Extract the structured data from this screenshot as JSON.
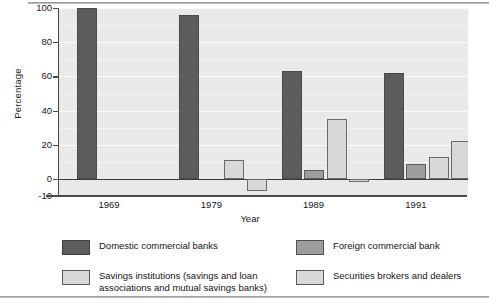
{
  "chart_data": {
    "type": "bar",
    "title": "",
    "xlabel": "Year",
    "ylabel": "Percentage",
    "categories": [
      "1969",
      "1979",
      "1989",
      "1991"
    ],
    "ylim": [
      -10,
      100
    ],
    "yticks": [
      -10,
      0,
      20,
      40,
      60,
      80,
      100
    ],
    "ytick_labels": [
      "-10",
      "0",
      "20",
      "40",
      "60",
      "80",
      "100"
    ],
    "grid": true,
    "legend_position": "below",
    "series": [
      {
        "name": "Domestic commercial banks",
        "color": "#5c5c5c",
        "values": [
          100,
          96,
          63,
          62
        ]
      },
      {
        "name": "Foreign commercial bank",
        "color": "#9d9d9d",
        "values": [
          null,
          null,
          5,
          9
        ]
      },
      {
        "name": "Savings institutions  (savings and loan\nassociations and mutual  savings banks)",
        "color": "#d8d8d8",
        "values": [
          null,
          11,
          35,
          13
        ]
      },
      {
        "name": "Securities brokers  and dealers",
        "color": "#d8d8d8",
        "values": [
          null,
          -7,
          -2,
          22
        ]
      }
    ]
  },
  "legend": {
    "items": [
      {
        "label": "Domestic commercial banks"
      },
      {
        "label": "Foreign commercial bank"
      },
      {
        "label": "Savings institutions  (savings and loan\nassociations and mutual  savings banks)"
      },
      {
        "label": "Securities brokers  and dealers"
      }
    ]
  },
  "axes": {
    "y_title": "Percentage",
    "x_title": "Year"
  }
}
